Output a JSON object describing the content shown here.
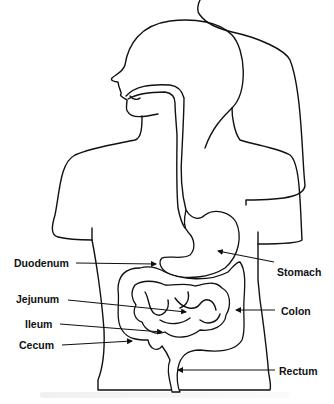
{
  "diagram": {
    "labels": {
      "duodenum": "Duodenum",
      "jejunum": "Jejunum",
      "ileum": "Ileum",
      "cecum": "Cecum",
      "stomach": "Stomach",
      "colon": "Colon",
      "rectum": "Rectum"
    }
  }
}
